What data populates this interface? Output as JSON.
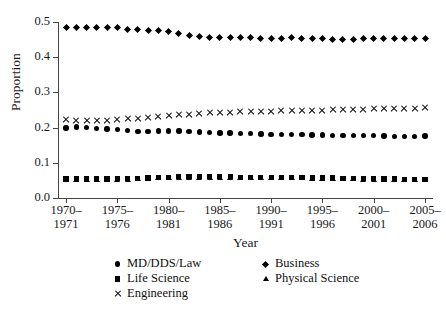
{
  "figure": {
    "top_rule": "horizontal-rule",
    "bottom_rule": "horizontal-rule"
  },
  "chart_data": {
    "type": "line",
    "title": "",
    "xlabel": "Year",
    "ylabel": "Proportion",
    "ylim": [
      0.0,
      0.5
    ],
    "ytick_labels": [
      "0.0",
      "0.1",
      "0.2",
      "0.3",
      "0.4",
      "0.5"
    ],
    "ytick_values": [
      0.0,
      0.1,
      0.2,
      0.3,
      0.4,
      0.5
    ],
    "xtick_labels": [
      "1970–\n1971",
      "1975–\n1976",
      "1980–\n1981",
      "1985–\n1986",
      "1990–\n1991",
      "1995–\n1996",
      "2000–\n2001",
      "2005–\n2006"
    ],
    "xtick_labels_top": [
      "1970–",
      "1975–",
      "1980–",
      "1985–",
      "1990–",
      "1995–",
      "2000–",
      "2005–"
    ],
    "xtick_labels_bottom": [
      "1971",
      "1976",
      "1981",
      "1986",
      "1991",
      "1996",
      "2001",
      "2006"
    ],
    "xtick_indices": [
      0,
      5,
      10,
      15,
      20,
      25,
      30,
      35
    ],
    "grid": false,
    "legend_position": "below-axes",
    "x": [
      "1970-1971",
      "1971-1972",
      "1972-1973",
      "1973-1974",
      "1974-1975",
      "1975-1976",
      "1976-1977",
      "1977-1978",
      "1978-1979",
      "1979-1980",
      "1980-1981",
      "1981-1982",
      "1982-1983",
      "1983-1984",
      "1984-1985",
      "1985-1986",
      "1986-1987",
      "1987-1988",
      "1988-1989",
      "1989-1990",
      "1990-1991",
      "1991-1992",
      "1992-1993",
      "1993-1994",
      "1994-1995",
      "1995-1996",
      "1996-1997",
      "1997-1998",
      "1998-1999",
      "1999-2000",
      "2000-2001",
      "2001-2002",
      "2002-2003",
      "2003-2004",
      "2004-2005",
      "2005-2006"
    ],
    "series": [
      {
        "name": "MD/DDS/Law",
        "marker": "circle",
        "values": [
          0.199,
          0.202,
          0.201,
          0.198,
          0.196,
          0.194,
          0.191,
          0.189,
          0.189,
          0.19,
          0.19,
          0.19,
          0.189,
          0.187,
          0.186,
          0.185,
          0.185,
          0.184,
          0.183,
          0.182,
          0.181,
          0.181,
          0.18,
          0.18,
          0.179,
          0.179,
          0.178,
          0.178,
          0.178,
          0.177,
          0.177,
          0.176,
          0.175,
          0.175,
          0.175,
          0.176
        ]
      },
      {
        "name": "Business",
        "marker": "diamond",
        "values": [
          0.483,
          0.484,
          0.484,
          0.485,
          0.484,
          0.483,
          0.479,
          0.478,
          0.477,
          0.476,
          0.473,
          0.467,
          0.461,
          0.458,
          0.456,
          0.456,
          0.456,
          0.456,
          0.455,
          0.453,
          0.453,
          0.454,
          0.455,
          0.454,
          0.453,
          0.452,
          0.451,
          0.45,
          0.45,
          0.452,
          0.453,
          0.454,
          0.454,
          0.454,
          0.453,
          0.452
        ]
      },
      {
        "name": "Life Science",
        "marker": "square",
        "values": [
          0.054,
          0.054,
          0.054,
          0.054,
          0.054,
          0.055,
          0.055,
          0.056,
          0.057,
          0.058,
          0.059,
          0.06,
          0.06,
          0.06,
          0.06,
          0.06,
          0.06,
          0.059,
          0.058,
          0.058,
          0.058,
          0.058,
          0.058,
          0.058,
          0.057,
          0.057,
          0.057,
          0.056,
          0.056,
          0.055,
          0.055,
          0.054,
          0.054,
          0.053,
          0.053,
          0.053
        ]
      },
      {
        "name": "Physical Science",
        "marker": "triangle",
        "values": [
          0.052,
          0.052,
          0.052,
          0.052,
          0.052,
          0.053,
          0.053,
          0.054,
          0.055,
          0.056,
          0.057,
          0.058,
          0.058,
          0.058,
          0.058,
          0.058,
          0.058,
          0.057,
          0.056,
          0.056,
          0.056,
          0.056,
          0.056,
          0.056,
          0.055,
          0.055,
          0.055,
          0.054,
          0.054,
          0.053,
          0.053,
          0.052,
          0.052,
          0.051,
          0.051,
          0.051
        ]
      },
      {
        "name": "Engineering",
        "marker": "cross",
        "values": [
          0.222,
          0.219,
          0.219,
          0.22,
          0.221,
          0.222,
          0.224,
          0.226,
          0.228,
          0.231,
          0.234,
          0.236,
          0.238,
          0.24,
          0.241,
          0.242,
          0.243,
          0.244,
          0.245,
          0.246,
          0.246,
          0.247,
          0.247,
          0.248,
          0.249,
          0.249,
          0.25,
          0.251,
          0.251,
          0.252,
          0.253,
          0.253,
          0.254,
          0.254,
          0.255,
          0.256
        ]
      }
    ],
    "legend": [
      {
        "label": "MD/DDS/Law",
        "marker": "circle",
        "column": 0,
        "row": 0
      },
      {
        "label": "Business",
        "marker": "diamond",
        "column": 1,
        "row": 0
      },
      {
        "label": "Life Science",
        "marker": "square",
        "column": 0,
        "row": 1
      },
      {
        "label": "Physical Science",
        "marker": "triangle",
        "column": 1,
        "row": 1
      },
      {
        "label": "Engineering",
        "marker": "cross",
        "column": 0,
        "row": 2
      }
    ]
  }
}
